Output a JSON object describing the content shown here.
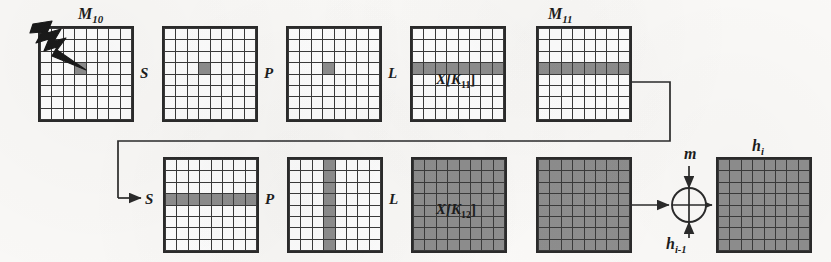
{
  "diagram": {
    "grid": {
      "rows": 8,
      "cols": 8
    },
    "colors": {
      "paper": "#fbfaf8",
      "ink": "#2b2b2b",
      "cell_fill": "#8e8e8e",
      "cell_empty": "#ffffff"
    },
    "top_row": {
      "label": "M10",
      "label_text": "M",
      "label_sub": "10",
      "end_label_text": "M",
      "end_label_sub": "11",
      "fault_icon": "lightning-bolt-icon",
      "operations": [
        {
          "name": "S",
          "label": "S"
        },
        {
          "name": "P",
          "label": "P"
        },
        {
          "name": "L",
          "label": "L"
        },
        {
          "name": "XK11",
          "label": "X[K",
          "sub": "11",
          "close": "]"
        }
      ],
      "states": [
        {
          "name": "M10",
          "pattern": "single-cell",
          "cells": [
            [
              3,
              3
            ]
          ]
        },
        {
          "name": "after-S",
          "pattern": "single-cell",
          "cells": [
            [
              3,
              3
            ]
          ]
        },
        {
          "name": "after-P",
          "pattern": "single-cell",
          "cells": [
            [
              3,
              3
            ]
          ]
        },
        {
          "name": "after-L",
          "pattern": "full-row",
          "row": 3
        },
        {
          "name": "M11",
          "pattern": "full-row",
          "row": 3
        }
      ]
    },
    "bottom_row": {
      "operations": [
        {
          "name": "S",
          "label": "S"
        },
        {
          "name": "P",
          "label": "P"
        },
        {
          "name": "L",
          "label": "L"
        },
        {
          "name": "XK12",
          "label": "X[K",
          "sub": "12",
          "close": "]"
        }
      ],
      "states": [
        {
          "name": "after-S",
          "pattern": "full-row",
          "row": 3
        },
        {
          "name": "after-P",
          "pattern": "full-column",
          "col": 3
        },
        {
          "name": "after-L",
          "pattern": "all"
        },
        {
          "name": "XK12-out",
          "pattern": "all"
        },
        {
          "name": "hi",
          "pattern": "all"
        }
      ],
      "result_label_text": "h",
      "result_label_sub": "i"
    },
    "xor": {
      "symbol": "xor-circle-icon",
      "input_top_text": "m",
      "input_top_sub": "",
      "input_bottom_text": "h",
      "input_bottom_sub": "i-1"
    },
    "connectors": [
      {
        "name": "m11-feedback-wire",
        "from": "M11",
        "to": "bottom-S"
      },
      {
        "name": "xk12-to-xor-wire",
        "from": "XK12-out",
        "to": "xor"
      },
      {
        "name": "xor-to-hi-wire",
        "from": "xor",
        "to": "hi"
      },
      {
        "name": "m-into-xor-wire",
        "from": "m",
        "to": "xor"
      },
      {
        "name": "hprev-into-xor-wire",
        "from": "h_{i-1}",
        "to": "xor"
      }
    ]
  }
}
